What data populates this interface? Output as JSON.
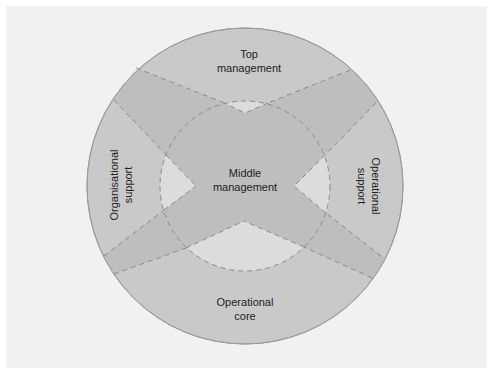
{
  "diagram": {
    "type": "concentric-organisation-structure",
    "colors": {
      "background": "#f1f1f1",
      "outer_ring": "#c9c9c9",
      "band": "#bebebe",
      "wedge": "#dcdcdc",
      "outline": "#9a9a9a",
      "dash": "#8a8a8a",
      "text": "#222222"
    },
    "labels": {
      "top": {
        "line1": "Top",
        "line2": "management"
      },
      "middle": {
        "line1": "Middle",
        "line2": "management"
      },
      "left": {
        "line1": "Organisational",
        "line2": "support"
      },
      "right": {
        "line1": "Operational",
        "line2": "support"
      },
      "bottom": {
        "line1": "Operational",
        "line2": "core"
      }
    }
  }
}
